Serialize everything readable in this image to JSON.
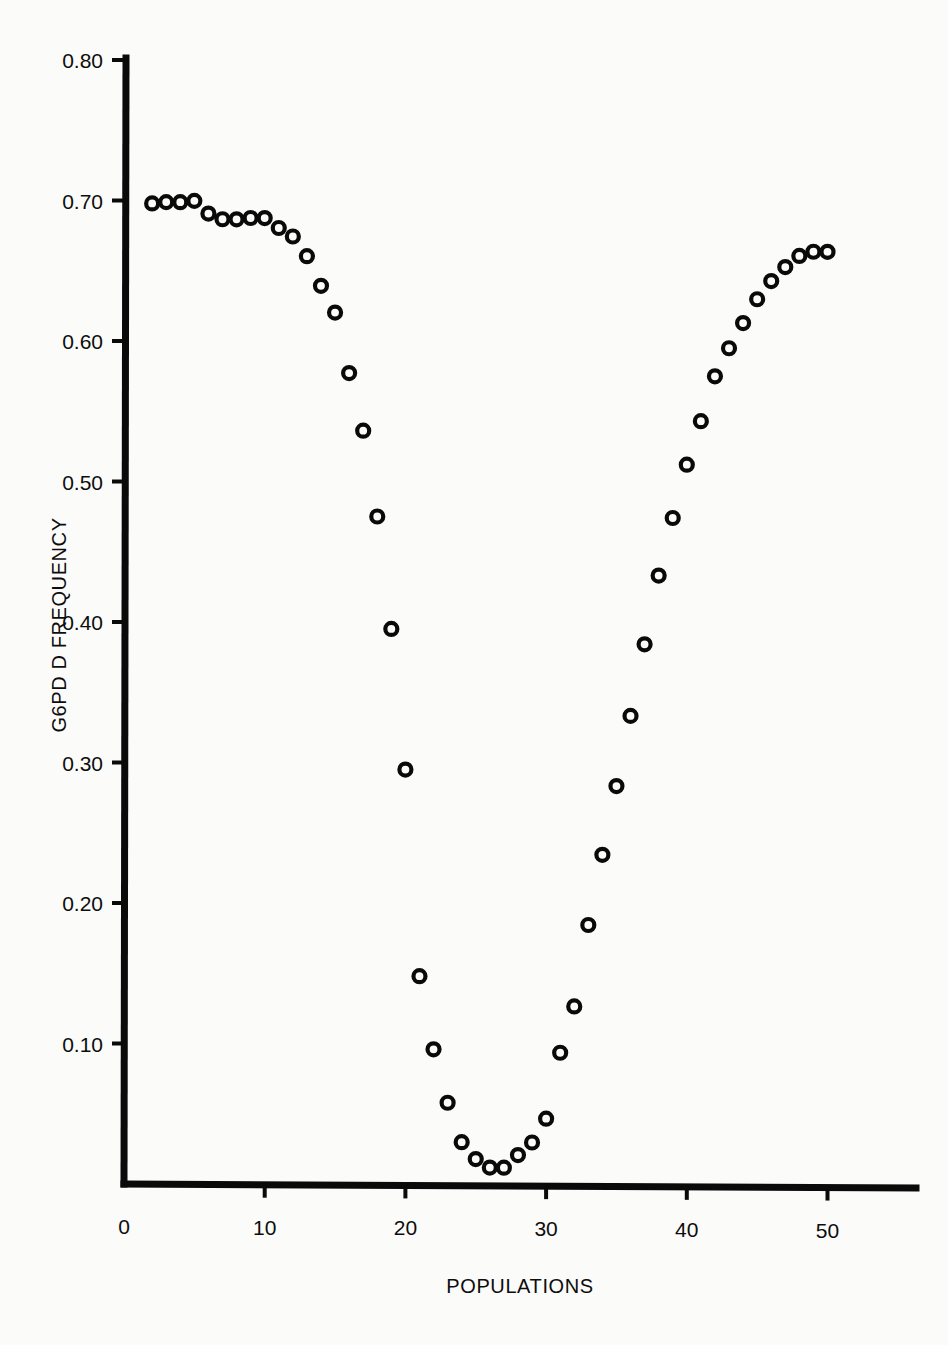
{
  "chart_data": {
    "type": "scatter",
    "title": "",
    "xlabel": "POPULATIONS",
    "ylabel": "G6PD D FREQUENCY",
    "xlim": [
      0,
      56
    ],
    "ylim": [
      0.0,
      0.8
    ],
    "grid": false,
    "legend": null,
    "marker": "open-circle",
    "x_ticks": [
      0,
      10,
      20,
      30,
      40,
      50
    ],
    "x_tick_labels": [
      "0",
      "10",
      "20",
      "30",
      "40",
      "50"
    ],
    "y_ticks": [
      0.1,
      0.2,
      0.3,
      0.4,
      0.5,
      0.6,
      0.7,
      0.8
    ],
    "y_tick_labels": [
      "0.10",
      "0.20",
      "0.30",
      "0.40",
      "0.50",
      "0.60",
      "0.70",
      "0.80"
    ],
    "x": [
      2,
      3,
      4,
      5,
      6,
      7,
      8,
      9,
      10,
      11,
      12,
      13,
      14,
      15,
      16,
      17,
      18,
      19,
      20,
      21,
      22,
      23,
      24,
      25,
      26,
      27,
      28,
      29,
      30,
      31,
      32,
      33,
      34,
      35,
      36,
      37,
      38,
      39,
      40,
      41,
      42,
      43,
      44,
      45,
      46,
      47,
      48,
      49,
      50
    ],
    "y": [
      0.698,
      0.699,
      0.699,
      0.7,
      0.691,
      0.687,
      0.687,
      0.688,
      0.688,
      0.681,
      0.675,
      0.661,
      0.64,
      0.621,
      0.578,
      0.537,
      0.476,
      0.396,
      0.296,
      0.149,
      0.097,
      0.059,
      0.031,
      0.019,
      0.013,
      0.013,
      0.022,
      0.031,
      0.048,
      0.095,
      0.128,
      0.186,
      0.236,
      0.285,
      0.335,
      0.386,
      0.435,
      0.476,
      0.514,
      0.545,
      0.577,
      0.597,
      0.615,
      0.632,
      0.645,
      0.655,
      0.663,
      0.666,
      0.666
    ],
    "point_count": 49
  },
  "axes": {
    "x_axis_name": "POPULATIONS",
    "y_axis_name": "G6PD D FREQUENCY"
  }
}
